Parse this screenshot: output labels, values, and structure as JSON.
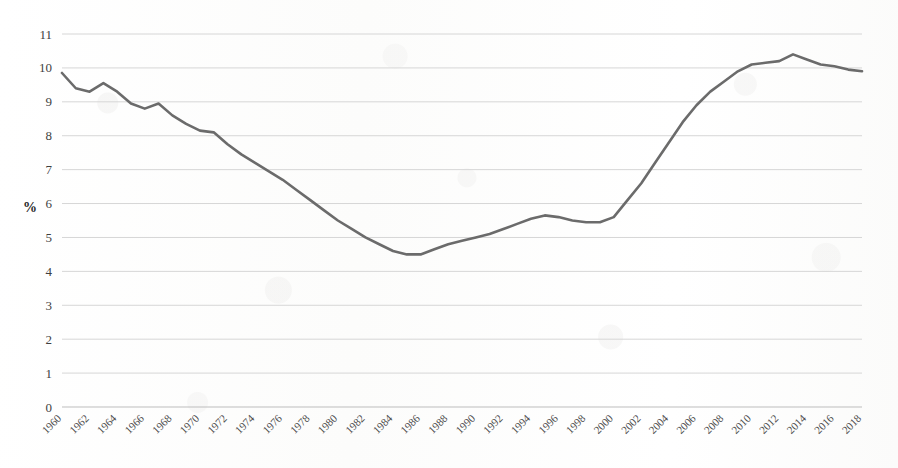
{
  "chart_data": {
    "type": "line",
    "title": "",
    "subtitle": "",
    "xlabel": "",
    "ylabel": "%",
    "ylim": [
      0,
      11
    ],
    "ytick_values": [
      0,
      1,
      2,
      3,
      4,
      5,
      6,
      7,
      8,
      9,
      10,
      11
    ],
    "ytick_labels": [
      "0",
      "1",
      "2",
      "3",
      "4",
      "5",
      "6",
      "7",
      "8",
      "9",
      "10",
      "11"
    ],
    "xlim": [
      1960,
      2018
    ],
    "xtick_labels": [
      "1960",
      "1962",
      "1964",
      "1966",
      "1968",
      "1970",
      "1972",
      "1974",
      "1976",
      "1978",
      "1980",
      "1982",
      "1984",
      "1986",
      "1988",
      "1990",
      "1992",
      "1994",
      "1996",
      "1998",
      "2000",
      "2002",
      "2004",
      "2006",
      "2008",
      "2010",
      "2012",
      "2014",
      "2016",
      "2018"
    ],
    "xtick_values": [
      1960,
      1962,
      1964,
      1966,
      1968,
      1970,
      1972,
      1974,
      1976,
      1978,
      1980,
      1982,
      1984,
      1986,
      1988,
      1990,
      1992,
      1994,
      1996,
      1998,
      2000,
      2002,
      2004,
      2006,
      2008,
      2010,
      2012,
      2014,
      2016,
      2018
    ],
    "grid": "horizontal",
    "legend": "none",
    "legend_position": "none",
    "line_color": "#6b6b6b",
    "grid_color": "#d6d6d6",
    "background_color": "#fdfdfd",
    "x": [
      1960,
      1961,
      1962,
      1963,
      1964,
      1965,
      1966,
      1967,
      1968,
      1969,
      1970,
      1971,
      1972,
      1973,
      1974,
      1975,
      1976,
      1977,
      1978,
      1979,
      1980,
      1981,
      1982,
      1983,
      1984,
      1985,
      1986,
      1987,
      1988,
      1989,
      1990,
      1991,
      1992,
      1993,
      1994,
      1995,
      1996,
      1997,
      1998,
      1999,
      2000,
      2001,
      2002,
      2003,
      2004,
      2005,
      2006,
      2007,
      2008,
      2009,
      2010,
      2011,
      2012,
      2013,
      2014,
      2015,
      2016,
      2017,
      2018
    ],
    "values": [
      9.85,
      9.4,
      9.3,
      9.55,
      9.3,
      8.95,
      8.8,
      8.95,
      8.6,
      8.35,
      8.15,
      8.1,
      7.75,
      7.45,
      7.2,
      6.95,
      6.7,
      6.4,
      6.1,
      5.8,
      5.5,
      5.25,
      5.0,
      4.8,
      4.6,
      4.5,
      4.5,
      4.65,
      4.8,
      4.9,
      5.0,
      5.1,
      5.25,
      5.4,
      5.55,
      5.65,
      5.6,
      5.5,
      5.45,
      5.45,
      5.6,
      6.1,
      6.6,
      7.2,
      7.8,
      8.4,
      8.9,
      9.3,
      9.6,
      9.9,
      10.1,
      10.15,
      10.2,
      10.4,
      10.25,
      10.1,
      10.05,
      9.95,
      9.9
    ],
    "values_note": "series continues to 2018",
    "values_tail": [
      9.75,
      9.5,
      9.25,
      9.0,
      9.0,
      9.85,
      9.6,
      9.35,
      9.2
    ]
  }
}
